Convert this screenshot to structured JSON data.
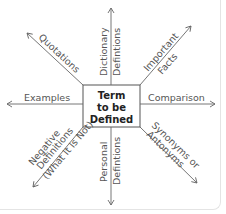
{
  "diagram": {
    "type": "concept-map",
    "center": {
      "line1": "Term",
      "line2": "to be",
      "line3": "Defined"
    },
    "branches": [
      {
        "id": "quotations",
        "direction": "upper-left",
        "lines": [
          "Quotations"
        ]
      },
      {
        "id": "dictionary",
        "direction": "up",
        "lines": [
          "Dictionary",
          "Defintions"
        ]
      },
      {
        "id": "important-facts",
        "direction": "upper-right",
        "lines": [
          "Important",
          "Facts"
        ]
      },
      {
        "id": "examples",
        "direction": "left",
        "lines": [
          "Examples"
        ]
      },
      {
        "id": "comparison",
        "direction": "right",
        "lines": [
          "Comparison"
        ]
      },
      {
        "id": "negative",
        "direction": "lower-left",
        "lines": [
          "Negative",
          "Definitions",
          "(What It Is Not)"
        ]
      },
      {
        "id": "personal",
        "direction": "down",
        "lines": [
          "Personal",
          "Defintions"
        ]
      },
      {
        "id": "synonyms",
        "direction": "lower-right",
        "lines": [
          "Synonyms or",
          "Antonyms"
        ]
      }
    ],
    "colors": {
      "line": "#666666",
      "text": "#555555",
      "box_border": "#555555"
    }
  }
}
